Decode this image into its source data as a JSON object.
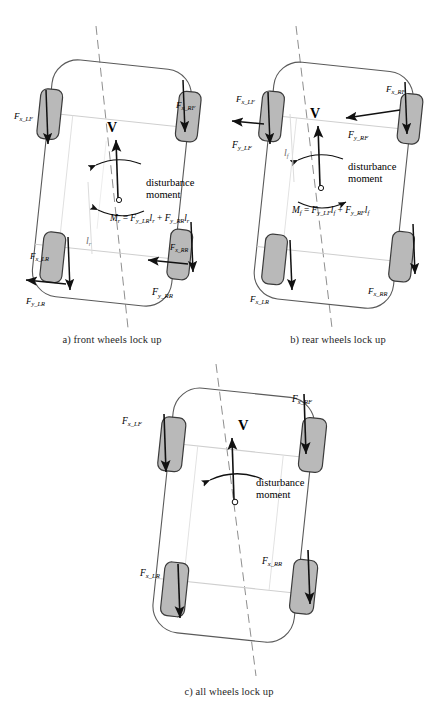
{
  "figure": {
    "type": "vehicle-dynamics-schematic",
    "colors": {
      "wheel_fill": "#b9b9b9",
      "wheel_stroke": "#3b3b3b",
      "body_stroke": "#5a5a5a",
      "axle_stroke": "#c9c9c9",
      "centerline_stroke": "#8f8f8f",
      "arrow_color": "#111111",
      "text_color": "#1a1a1a"
    }
  },
  "panels": [
    {
      "id": "a",
      "caption": "a) front wheels lock up",
      "velocity_label": "V",
      "moment_label_line1": "disturbance",
      "moment_label_line2": "moment",
      "dimension_label": "l",
      "dimension_sub": "r",
      "equation": {
        "lhs_main": "M",
        "lhs_sub": "r",
        "eq": "=",
        "t1_main": "F",
        "t1_sub": "y_LR",
        "t1_len_main": "l",
        "t1_len_sub": "r",
        "plus": "+",
        "t2_main": "F",
        "t2_sub": "y_RR",
        "t2_len_main": "l",
        "t2_len_sub": "r",
        "plain": "M_r = F_y_LR l_r + F_y_RR l_r"
      },
      "force_labels": [
        {
          "name": "force-lf",
          "main": "F",
          "sub": "x_LF"
        },
        {
          "name": "force-rf",
          "main": "F",
          "sub": "x_RF"
        },
        {
          "name": "force-lr-x",
          "main": "F",
          "sub": "x_LR"
        },
        {
          "name": "force-lr-y",
          "main": "F",
          "sub": "y_LR"
        },
        {
          "name": "force-rr-x",
          "main": "F",
          "sub": "x_RR"
        },
        {
          "name": "force-rr-y",
          "main": "F",
          "sub": "y_RR"
        }
      ]
    },
    {
      "id": "b",
      "caption": "b) rear wheels lock up",
      "velocity_label": "V",
      "moment_label_line1": "disturbance",
      "moment_label_line2": "moment",
      "dimension_label": "l",
      "dimension_sub": "f",
      "equation": {
        "lhs_main": "M",
        "lhs_sub": "f",
        "eq": "=",
        "t1_main": "F",
        "t1_sub": "y_LF",
        "t1_len_main": "l",
        "t1_len_sub": "f",
        "plus": "+",
        "t2_main": "F",
        "t2_sub": "y_RF",
        "t2_len_main": "l",
        "t2_len_sub": "f",
        "plain": "M_f = F_y_LF l_f + F_y_RF l_f"
      },
      "force_labels": [
        {
          "name": "force-lf-x",
          "main": "F",
          "sub": "x_LF"
        },
        {
          "name": "force-lf-y",
          "main": "F",
          "sub": "y_LF"
        },
        {
          "name": "force-rf-x",
          "main": "F",
          "sub": "x_RF"
        },
        {
          "name": "force-rf-y",
          "main": "F",
          "sub": "y_RF"
        },
        {
          "name": "force-lr",
          "main": "F",
          "sub": "x_LR"
        },
        {
          "name": "force-rr",
          "main": "F",
          "sub": "x_RR"
        }
      ]
    },
    {
      "id": "c",
      "caption": "c) all wheels lock up",
      "velocity_label": "V",
      "moment_label_line1": "disturbance",
      "moment_label_line2": "moment",
      "force_labels": [
        {
          "name": "force-lf",
          "main": "F",
          "sub": "x_LF"
        },
        {
          "name": "force-rf",
          "main": "F",
          "sub": "x_RF"
        },
        {
          "name": "force-lr",
          "main": "F",
          "sub": "x_LR"
        },
        {
          "name": "force-rr",
          "main": "F",
          "sub": "x_RR"
        }
      ]
    }
  ]
}
